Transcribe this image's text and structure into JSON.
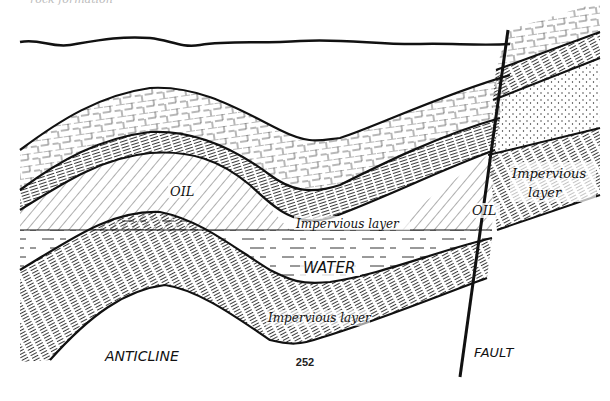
{
  "figure": {
    "caption_fragment": "rock formation",
    "page_number": "252",
    "labels": {
      "oil_left": "OIL",
      "oil_right": "OIL",
      "impervious_upper_middle": "Impervious layer",
      "impervious_right_line1": "Impervious",
      "impervious_right_line2": "layer",
      "water": "WATER",
      "impervious_lower": "Impervious layer",
      "anticline": "ANTICLINE",
      "fault": "FAULT"
    },
    "layers": [
      {
        "name": "limestone-cap",
        "pattern": "brick"
      },
      {
        "name": "upper-impervious-shale",
        "pattern": "dense-lines"
      },
      {
        "name": "oil-reservoir",
        "pattern": "diagonal-hatch"
      },
      {
        "name": "water-zone",
        "pattern": "dashes"
      },
      {
        "name": "lower-impervious-shale",
        "pattern": "dense-lines"
      },
      {
        "name": "sandstone",
        "pattern": "dots"
      }
    ],
    "colors": {
      "ink": "#111111",
      "paper": "#ffffff"
    }
  }
}
